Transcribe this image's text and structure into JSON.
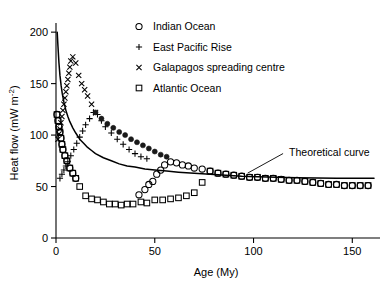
{
  "figure": {
    "background": "#ffffff",
    "ink": "#000000"
  },
  "axes": {
    "x": {
      "label": "Age (My)",
      "ticks": [
        "0",
        "50",
        "100",
        "150"
      ],
      "tick_values": [
        0,
        50,
        100,
        150
      ],
      "range": [
        0,
        162
      ]
    },
    "y": {
      "label_plain": "Heat flow (mW m",
      "label_super": "-2",
      "label_tail": ")",
      "label_full": "Heat flow (mW m⁻²)",
      "ticks": [
        "0",
        "50",
        "100",
        "150",
        "200"
      ],
      "tick_values": [
        0,
        50,
        100,
        150,
        200
      ],
      "range": [
        0,
        205
      ]
    }
  },
  "legend": {
    "items": [
      {
        "marker": "circle-open-marker",
        "label": "Indian Ocean"
      },
      {
        "marker": "plus-marker",
        "label": "East Pacific Rise"
      },
      {
        "marker": "cross-marker",
        "label": "Galapagos spreading centre"
      },
      {
        "marker": "square-open-marker",
        "label": "Atlantic Ocean"
      }
    ]
  },
  "annotations": [
    {
      "name": "theoretical-curve-label",
      "text": "Theoretical curve"
    }
  ],
  "chart_data": {
    "type": "scatter",
    "title": "",
    "xlabel": "Age (My)",
    "ylabel": "Heat flow (mW m⁻²)",
    "xlim": [
      0,
      162
    ],
    "ylim": [
      0,
      205
    ],
    "grid": false,
    "legend_position": "top-center",
    "annotations": [
      {
        "text": "Theoretical curve",
        "x": 118,
        "y": 84,
        "points_to": {
          "x": 97,
          "y": 63
        }
      }
    ],
    "series": [
      {
        "name": "Theoretical curve",
        "type": "line",
        "marker": "none",
        "points": [
          [
            0.6,
            200
          ],
          [
            1.0,
            186
          ],
          [
            1.5,
            170
          ],
          [
            2.0,
            158
          ],
          [
            2.6,
            148
          ],
          [
            3.2,
            140
          ],
          [
            4.0,
            132
          ],
          [
            5.0,
            124
          ],
          [
            6.0,
            118
          ],
          [
            7.0,
            113
          ],
          [
            8.5,
            107
          ],
          [
            10,
            102
          ],
          [
            12,
            96
          ],
          [
            14,
            92
          ],
          [
            16,
            88
          ],
          [
            18,
            85
          ],
          [
            20,
            82
          ],
          [
            24,
            78
          ],
          [
            28,
            75
          ],
          [
            32,
            72
          ],
          [
            36,
            70
          ],
          [
            40,
            69
          ],
          [
            45,
            67
          ],
          [
            50,
            66
          ],
          [
            56,
            65
          ],
          [
            62,
            64
          ],
          [
            70,
            63
          ],
          [
            78,
            62
          ],
          [
            86,
            61
          ],
          [
            94,
            60
          ],
          [
            102,
            59.5
          ],
          [
            112,
            59
          ],
          [
            122,
            58.6
          ],
          [
            132,
            58.3
          ],
          [
            142,
            58.1
          ],
          [
            152,
            58
          ],
          [
            161,
            58
          ]
        ]
      },
      {
        "name": "Galapagos spreading centre",
        "type": "scatter",
        "marker": "cross-marker",
        "points": [
          [
            1.0,
            96
          ],
          [
            1.5,
            101
          ],
          [
            2.0,
            106
          ],
          [
            2.5,
            112
          ],
          [
            3.0,
            118
          ],
          [
            3.5,
            124
          ],
          [
            4.0,
            130
          ],
          [
            4.5,
            136
          ],
          [
            5.0,
            142
          ],
          [
            5.5,
            148
          ],
          [
            6.0,
            154
          ],
          [
            6.5,
            160
          ],
          [
            7.0,
            166
          ],
          [
            7.5,
            172
          ],
          [
            8.5,
            176
          ],
          [
            10.0,
            170
          ],
          [
            11.5,
            158
          ],
          [
            13.0,
            150
          ],
          [
            14.5,
            144
          ],
          [
            16.0,
            138
          ],
          [
            18.0,
            130
          ],
          [
            20.0,
            122
          ]
        ]
      },
      {
        "name": "East Pacific Rise",
        "type": "scatter",
        "marker": "plus-marker",
        "points": [
          [
            2.0,
            58
          ],
          [
            3.0,
            62
          ],
          [
            4.0,
            66
          ],
          [
            5.0,
            70
          ],
          [
            6.0,
            74
          ],
          [
            7.5,
            80
          ],
          [
            9.0,
            86
          ],
          [
            10.5,
            92
          ],
          [
            12.0,
            98
          ],
          [
            13.5,
            104
          ],
          [
            15.0,
            110
          ],
          [
            17.0,
            116
          ],
          [
            19.0,
            122
          ],
          [
            21.0,
            120
          ],
          [
            23.0,
            114
          ],
          [
            25.0,
            108
          ],
          [
            28.0,
            102
          ],
          [
            31.0,
            96
          ],
          [
            34.0,
            91
          ],
          [
            37.0,
            86
          ],
          [
            40.0,
            82
          ],
          [
            43.0,
            79
          ],
          [
            46.0,
            77
          ]
        ]
      },
      {
        "name": "Indian Ocean",
        "type": "scatter",
        "marker": "circle-open-marker",
        "points": [
          [
            0.5,
            120
          ],
          [
            1.0,
            114
          ],
          [
            1.5,
            108
          ],
          [
            2.0,
            103
          ],
          [
            2.5,
            97
          ],
          [
            3.0,
            91
          ],
          [
            3.5,
            86
          ],
          [
            4.5,
            80
          ],
          [
            5.5,
            75
          ],
          [
            7.0,
            68
          ],
          [
            8.5,
            63
          ],
          [
            10.0,
            58
          ],
          [
            42,
            42
          ],
          [
            45,
            47
          ],
          [
            47,
            52
          ],
          [
            49,
            55
          ],
          [
            51,
            62
          ],
          [
            53,
            66
          ],
          [
            55,
            71
          ],
          [
            58,
            74
          ],
          [
            61,
            73
          ],
          [
            64,
            71
          ],
          [
            67,
            70
          ],
          [
            70,
            68
          ],
          [
            74,
            67
          ],
          [
            78,
            65
          ],
          [
            82,
            63
          ],
          [
            86,
            62
          ],
          [
            90,
            61
          ],
          [
            94,
            60
          ],
          [
            98,
            59
          ],
          [
            102,
            59
          ],
          [
            106,
            58
          ],
          [
            110,
            58
          ],
          [
            114,
            57
          ],
          [
            118,
            56
          ],
          [
            122,
            56
          ],
          [
            126,
            55
          ],
          [
            130,
            54
          ],
          [
            134,
            53
          ],
          [
            138,
            52
          ],
          [
            142,
            52
          ],
          [
            146,
            51
          ],
          [
            150,
            51
          ],
          [
            154,
            51
          ],
          [
            158,
            51
          ]
        ]
      },
      {
        "name": "Atlantic Ocean",
        "type": "scatter",
        "marker": "square-open-marker",
        "points": [
          [
            0.5,
            120
          ],
          [
            1.0,
            114
          ],
          [
            1.5,
            108
          ],
          [
            2.0,
            103
          ],
          [
            2.5,
            97
          ],
          [
            3.0,
            91
          ],
          [
            3.5,
            86
          ],
          [
            4.5,
            80
          ],
          [
            5.5,
            75
          ],
          [
            7.0,
            68
          ],
          [
            8.5,
            63
          ],
          [
            10.0,
            58
          ],
          [
            12.0,
            50
          ],
          [
            15,
            41
          ],
          [
            18,
            38
          ],
          [
            21,
            37
          ],
          [
            24,
            35
          ],
          [
            27,
            33
          ],
          [
            30,
            33
          ],
          [
            33,
            32
          ],
          [
            36,
            33
          ],
          [
            39,
            33
          ],
          [
            43,
            35
          ],
          [
            46,
            34
          ],
          [
            50,
            37
          ],
          [
            54,
            37
          ],
          [
            58,
            38
          ],
          [
            62,
            39
          ],
          [
            66,
            41
          ],
          [
            70,
            44
          ],
          [
            74,
            54
          ],
          [
            78,
            65
          ],
          [
            82,
            63
          ],
          [
            86,
            62
          ],
          [
            90,
            61
          ],
          [
            94,
            60
          ],
          [
            98,
            59
          ],
          [
            102,
            59
          ],
          [
            106,
            58
          ],
          [
            110,
            58
          ],
          [
            114,
            57
          ],
          [
            118,
            56
          ],
          [
            122,
            56
          ],
          [
            126,
            55
          ],
          [
            130,
            54
          ],
          [
            134,
            53
          ],
          [
            138,
            52
          ],
          [
            142,
            52
          ],
          [
            146,
            51
          ],
          [
            150,
            51
          ],
          [
            154,
            51
          ],
          [
            158,
            51
          ]
        ]
      },
      {
        "name": "Overlapping circle-square band",
        "type": "scatter",
        "marker": "filled-dot-marker",
        "points": [
          [
            20,
            122
          ],
          [
            23,
            116
          ],
          [
            26,
            111
          ],
          [
            29,
            107
          ],
          [
            32,
            103
          ],
          [
            35,
            100
          ],
          [
            38,
            96
          ],
          [
            41,
            93
          ],
          [
            44,
            90
          ],
          [
            47,
            87
          ],
          [
            50,
            84
          ],
          [
            53,
            81
          ],
          [
            56,
            79
          ]
        ]
      }
    ]
  }
}
